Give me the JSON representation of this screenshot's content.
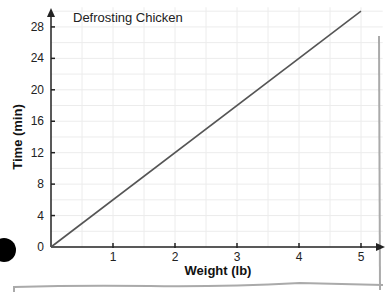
{
  "chart_data": {
    "type": "line",
    "title": "Defrosting Chicken",
    "xlabel": "Weight (lb)",
    "ylabel": "Time (min)",
    "xlim": [
      0,
      5
    ],
    "ylim": [
      0,
      28
    ],
    "x_ticks": [
      1,
      2,
      3,
      4,
      5
    ],
    "y_ticks": [
      0,
      4,
      8,
      12,
      16,
      20,
      24,
      28
    ],
    "grid": true,
    "series": [
      {
        "name": "Defrosting Chicken",
        "x": [
          0,
          5
        ],
        "y": [
          0,
          30
        ]
      }
    ],
    "colors": {
      "line": "#555555",
      "axis": "#222222",
      "grid": "#ececec"
    }
  }
}
